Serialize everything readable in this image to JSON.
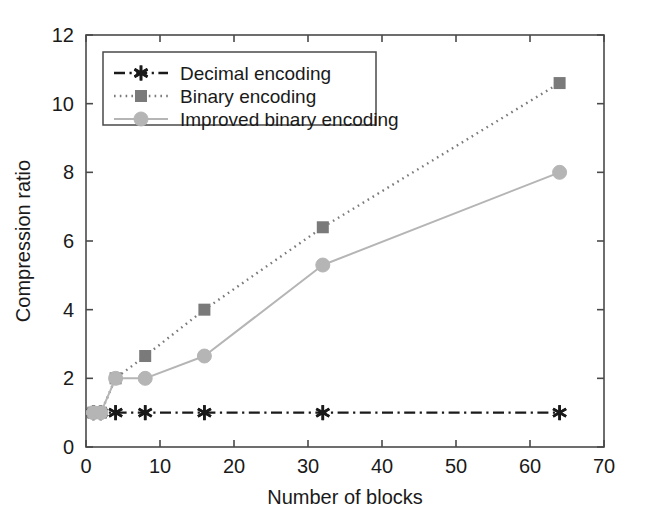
{
  "chart_data": {
    "type": "line",
    "title": "",
    "xlabel": "Number of blocks",
    "ylabel": "Compression ratio",
    "xlim": [
      0,
      70
    ],
    "ylim": [
      0,
      12
    ],
    "xticks": [
      0,
      10,
      20,
      30,
      40,
      50,
      60,
      70
    ],
    "yticks": [
      0,
      2,
      4,
      6,
      8,
      10,
      12
    ],
    "xtick_labels": [
      "0",
      "10",
      "20",
      "30",
      "40",
      "50",
      "60",
      "70"
    ],
    "ytick_labels": [
      "0",
      "2",
      "4",
      "6",
      "8",
      "10",
      "12"
    ],
    "grid": false,
    "legend_position": "upper left",
    "x": [
      1,
      2,
      4,
      8,
      16,
      32,
      64
    ],
    "series": [
      {
        "name": "Decimal encoding",
        "values": [
          1.0,
          1.0,
          1.0,
          1.0,
          1.0,
          1.0,
          1.0
        ],
        "color": "#1a1a1a",
        "marker": "asterisk",
        "linestyle": "dash-dot"
      },
      {
        "name": "Binary encoding",
        "values": [
          1.0,
          1.0,
          2.0,
          2.65,
          4.0,
          6.4,
          10.6
        ],
        "color": "#7a7a7a",
        "marker": "square",
        "linestyle": "dotted"
      },
      {
        "name": "Improved binary encoding",
        "values": [
          1.0,
          1.0,
          2.0,
          2.0,
          2.65,
          5.3,
          8.0
        ],
        "color": "#b5b5b5",
        "marker": "circle",
        "linestyle": "solid"
      }
    ]
  },
  "legend": {
    "items": [
      {
        "label": "Decimal encoding"
      },
      {
        "label": "Binary encoding"
      },
      {
        "label": "Improved binary encoding"
      }
    ]
  },
  "axes": {
    "x_title": "Number of blocks",
    "y_title": "Compression ratio"
  },
  "colors": {
    "axis": "#4a4a4a",
    "background": "#ffffff",
    "decimal": "#1a1a1a",
    "binary": "#7a7a7a",
    "improved_binary": "#b5b5b5"
  }
}
